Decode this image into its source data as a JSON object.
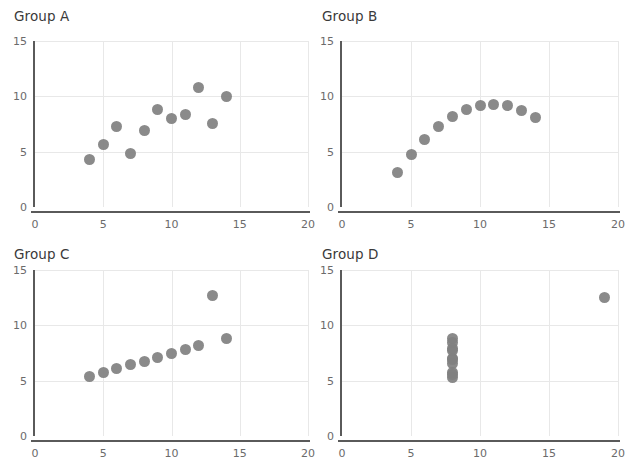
{
  "figure": {
    "background_color": "#ffffff",
    "marker_color": "#808080",
    "grid_color": "#e8e8e8",
    "axis_color": "#5a5a5a",
    "tick_label_color": "#6b6b6b",
    "title_color": "#3a3a3a"
  },
  "chart_data": [
    {
      "type": "scatter",
      "title": "Group A",
      "xlabel": "",
      "ylabel": "",
      "xlim": [
        0,
        20
      ],
      "ylim": [
        0,
        15
      ],
      "xticks": [
        0,
        5,
        10,
        15,
        20
      ],
      "yticks": [
        0,
        5,
        10,
        15
      ],
      "xtick_labels": [
        "0",
        "5",
        "10",
        "15",
        "20"
      ],
      "ytick_labels": [
        "0",
        "5",
        "10",
        "15"
      ],
      "grid": true,
      "legend": "none",
      "x": [
        10,
        8,
        13,
        9,
        11,
        14,
        6,
        4,
        12,
        7,
        5
      ],
      "y": [
        8.04,
        6.95,
        7.58,
        8.81,
        8.33,
        9.96,
        7.24,
        4.26,
        10.84,
        4.82,
        5.68
      ]
    },
    {
      "type": "scatter",
      "title": "Group B",
      "xlabel": "",
      "ylabel": "",
      "xlim": [
        0,
        20
      ],
      "ylim": [
        0,
        15
      ],
      "xticks": [
        0,
        5,
        10,
        15,
        20
      ],
      "yticks": [
        0,
        5,
        10,
        15
      ],
      "xtick_labels": [
        "0",
        "5",
        "10",
        "15",
        "20"
      ],
      "ytick_labels": [
        "0",
        "5",
        "10",
        "15"
      ],
      "grid": true,
      "legend": "none",
      "x": [
        10,
        8,
        13,
        9,
        11,
        14,
        6,
        4,
        12,
        7,
        5
      ],
      "y": [
        9.14,
        8.14,
        8.74,
        8.77,
        9.26,
        8.1,
        6.13,
        3.1,
        9.13,
        7.26,
        4.74
      ]
    },
    {
      "type": "scatter",
      "title": "Group C",
      "xlabel": "",
      "ylabel": "",
      "xlim": [
        0,
        20
      ],
      "ylim": [
        0,
        15
      ],
      "xticks": [
        0,
        5,
        10,
        15,
        20
      ],
      "yticks": [
        0,
        5,
        10,
        15
      ],
      "xtick_labels": [
        "0",
        "5",
        "10",
        "15",
        "20"
      ],
      "ytick_labels": [
        "0",
        "5",
        "10",
        "15"
      ],
      "grid": true,
      "legend": "none",
      "x": [
        10,
        8,
        13,
        9,
        11,
        14,
        6,
        4,
        12,
        7,
        5
      ],
      "y": [
        7.46,
        6.77,
        12.74,
        7.11,
        7.81,
        8.84,
        6.08,
        5.39,
        8.15,
        6.42,
        5.73
      ]
    },
    {
      "type": "scatter",
      "title": "Group D",
      "xlabel": "",
      "ylabel": "",
      "xlim": [
        0,
        20
      ],
      "ylim": [
        0,
        15
      ],
      "xticks": [
        0,
        5,
        10,
        15,
        20
      ],
      "yticks": [
        0,
        5,
        10,
        15
      ],
      "xtick_labels": [
        "0",
        "5",
        "10",
        "15",
        "20"
      ],
      "ytick_labels": [
        "0",
        "5",
        "10",
        "15"
      ],
      "grid": true,
      "legend": "none",
      "x": [
        8,
        8,
        8,
        8,
        8,
        8,
        8,
        19,
        8,
        8,
        8
      ],
      "y": [
        6.58,
        5.76,
        7.71,
        8.84,
        8.47,
        7.04,
        5.25,
        12.5,
        5.56,
        7.91,
        6.89
      ]
    }
  ]
}
